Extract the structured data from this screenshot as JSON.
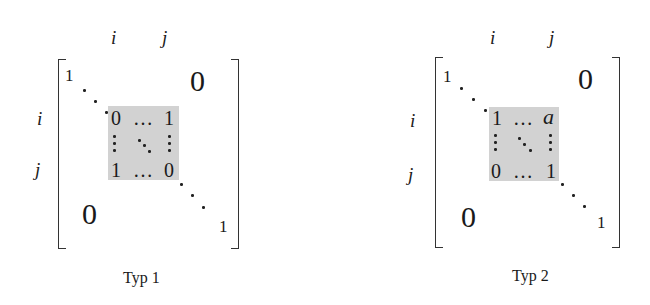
{
  "diagrams": [
    {
      "caption": "Typ 1",
      "col_labels": [
        "i",
        "j"
      ],
      "row_labels": [
        "i",
        "j"
      ],
      "diag_start": "1",
      "diag_end": "1",
      "upper_zero": "0",
      "lower_zero": "0",
      "block": {
        "tl": "0",
        "tr": "1",
        "bl": "1",
        "br": "0",
        "h_ellipsis": "…"
      },
      "highlight_color": "#d2d2d2"
    },
    {
      "caption": "Typ 2",
      "col_labels": [
        "i",
        "j"
      ],
      "row_labels": [
        "i",
        "j"
      ],
      "diag_start": "1",
      "diag_end": "1",
      "upper_zero": "0",
      "lower_zero": "0",
      "block": {
        "tl": "1",
        "tr": "a",
        "bl": "0",
        "br": "1",
        "h_ellipsis": "…"
      },
      "highlight_color": "#d2d2d2"
    }
  ]
}
